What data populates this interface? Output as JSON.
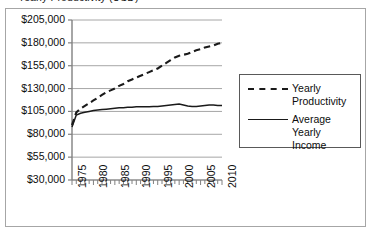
{
  "figure": {
    "clipped_title": "Yearly Productivity (USD)",
    "background_color": "#ffffff",
    "frame_color": "#a6a6a6"
  },
  "chart_data": {
    "type": "line",
    "title": "Yearly Productivity (USD)",
    "xlabel": "",
    "ylabel": "",
    "grid": true,
    "legend_position": "right",
    "xlim": [
      1975,
      2010
    ],
    "ylim": [
      30000,
      205000
    ],
    "ytick_labels": [
      "$205,000",
      "$180,000",
      "$155,000",
      "$130,000",
      "$105,000",
      "$80,000",
      "$55,000",
      "$30,000"
    ],
    "ytick_values": [
      205000,
      180000,
      155000,
      130000,
      105000,
      80000,
      55000,
      30000
    ],
    "xtick_labels": [
      "1975",
      "1980",
      "1985",
      "1990",
      "1995",
      "2000",
      "2005",
      "2010"
    ],
    "xtick_values": [
      1975,
      1980,
      1985,
      1990,
      1995,
      2000,
      2005,
      2010
    ],
    "x": [
      1975,
      1976,
      1977,
      1978,
      1979,
      1980,
      1981,
      1982,
      1983,
      1984,
      1985,
      1986,
      1987,
      1988,
      1989,
      1990,
      1991,
      1992,
      1993,
      1994,
      1995,
      1996,
      1997,
      1998,
      1999,
      2000,
      2001,
      2002,
      2003,
      2004,
      2005,
      2006,
      2007,
      2008,
      2009,
      2010
    ],
    "series": [
      {
        "name": "Yearly Productivity",
        "style": "dashed",
        "color": "#1a1a1a",
        "values": [
          90000,
          104000,
          108000,
          111000,
          114000,
          117000,
          120000,
          123000,
          126000,
          128000,
          130000,
          133000,
          135000,
          138000,
          140000,
          142000,
          144000,
          146000,
          148000,
          150000,
          152000,
          155000,
          158000,
          161000,
          164000,
          166000,
          167000,
          168000,
          170000,
          172000,
          173000,
          175000,
          176000,
          177000,
          179000,
          180000
        ]
      },
      {
        "name": "Average Yearly Income",
        "style": "solid",
        "color": "#1a1a1a",
        "values": [
          88000,
          101000,
          103000,
          104000,
          105000,
          106000,
          106500,
          107000,
          107500,
          108000,
          108500,
          109000,
          109000,
          109500,
          109500,
          110000,
          110000,
          110000,
          110000,
          110500,
          110500,
          111000,
          111500,
          112000,
          112500,
          113000,
          112000,
          111000,
          110500,
          110500,
          111000,
          111500,
          112000,
          112000,
          111500,
          111500
        ]
      }
    ]
  },
  "legend": {
    "entries": [
      {
        "label": "Yearly Productivity",
        "style": "dashed"
      },
      {
        "label": "Average Yearly Income",
        "style": "solid"
      }
    ]
  }
}
